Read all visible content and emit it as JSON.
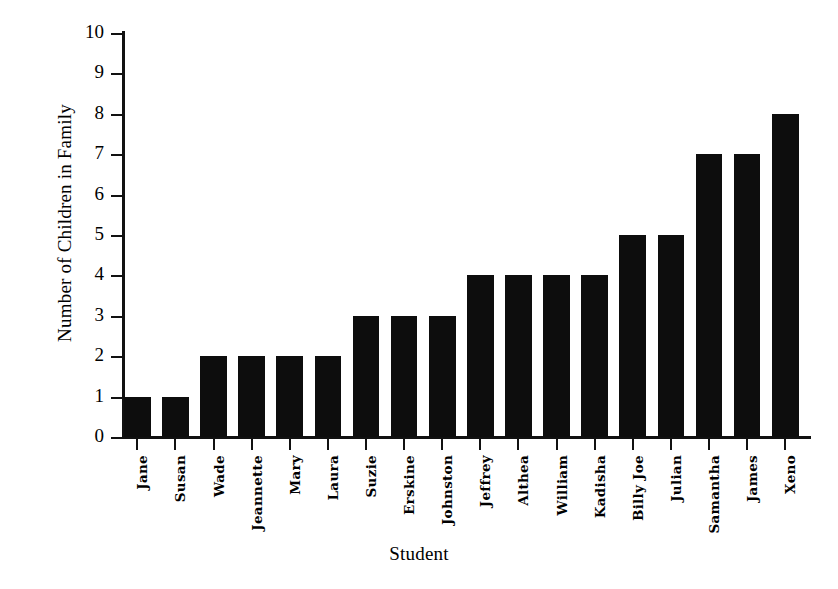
{
  "chart_data": {
    "type": "bar",
    "title": "",
    "xlabel": "Student",
    "ylabel": "Number of Children in Family",
    "categories": [
      "Jane",
      "Susan",
      "Wade",
      "Jeannette",
      "Mary",
      "Laura",
      "Suzie",
      "Erskine",
      "Johnston",
      "Jeffrey",
      "Althea",
      "William",
      "Kadisha",
      "Billy Joe",
      "Julian",
      "Samantha",
      "James",
      "Xeno"
    ],
    "values": [
      1,
      1,
      2,
      2,
      2,
      2,
      3,
      3,
      3,
      4,
      4,
      4,
      4,
      5,
      5,
      7,
      7,
      8
    ],
    "ylim": [
      0,
      10
    ],
    "xlim": [
      0,
      18
    ],
    "y_ticks": [
      "0",
      "1",
      "2",
      "3",
      "4",
      "5",
      "6",
      "7",
      "8",
      "9",
      "10"
    ],
    "grid": false,
    "legend": null,
    "bar_color": "#0d0d0d",
    "axis_color": "#111111",
    "background_color": "#ffffff"
  }
}
